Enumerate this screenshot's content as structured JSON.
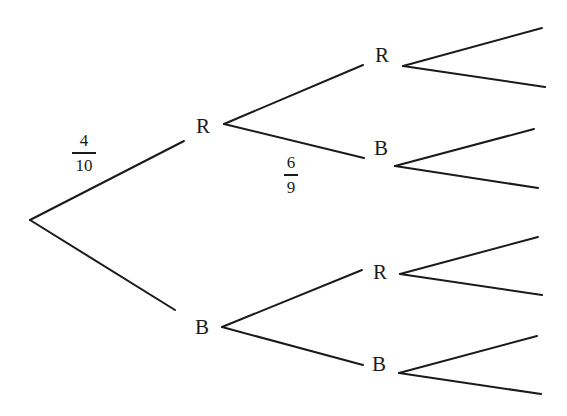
{
  "diagram": {
    "type": "probability-tree",
    "line_color": "#1a1a1a",
    "background": "#ffffff",
    "nodes": {
      "level1_top": {
        "label": "R"
      },
      "level1_bottom": {
        "label": "B"
      },
      "level2_1": {
        "label": "R"
      },
      "level2_2": {
        "label": "B"
      },
      "level2_3": {
        "label": "R"
      },
      "level2_4": {
        "label": "B"
      }
    },
    "edge_labels": {
      "root_to_R": {
        "numerator": "4",
        "denominator": "10"
      },
      "R_to_B": {
        "numerator": "6",
        "denominator": "9"
      }
    },
    "third_level_branches": 8
  }
}
